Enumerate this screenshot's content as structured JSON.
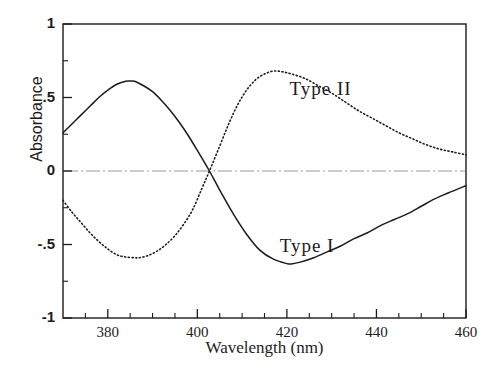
{
  "chart_data": {
    "type": "line",
    "title": "",
    "xlabel": "Wavelength (nm)",
    "ylabel": "Absorbance",
    "xlim": [
      370,
      460
    ],
    "ylim": [
      -1,
      1
    ],
    "grid": false,
    "zero_line": true,
    "legend_position": "inline-annotation",
    "xticks": [
      380,
      400,
      420,
      440,
      460
    ],
    "xtick_labels": [
      "380",
      "400",
      "420",
      "440",
      "460"
    ],
    "xminor_ticks": [
      375,
      385,
      390,
      395,
      405,
      410,
      415,
      425,
      430,
      435,
      445,
      450,
      455
    ],
    "yticks": [
      1,
      0.5,
      0,
      -0.5,
      -1
    ],
    "ytick_labels": [
      "1",
      ".5",
      "0",
      "-.5",
      "-1"
    ],
    "yminor_ticks": [
      0.75,
      0.25,
      -0.25,
      -0.75
    ],
    "series": [
      {
        "name": "Type I",
        "style": "solid",
        "color": "#1c1c1c",
        "label_position": {
          "x": 430,
          "y": -0.52
        },
        "x": [
          370,
          372,
          374,
          376,
          378,
          380,
          382,
          384,
          385,
          386,
          388,
          390,
          392,
          394,
          396,
          398,
          400,
          402.7,
          405,
          408,
          411,
          414,
          417,
          420,
          421,
          423,
          426,
          429,
          432,
          435,
          438,
          441,
          444,
          447,
          450,
          453,
          456,
          460
        ],
        "y": [
          0.26,
          0.32,
          0.38,
          0.44,
          0.5,
          0.55,
          0.59,
          0.61,
          0.612,
          0.61,
          0.58,
          0.54,
          0.48,
          0.41,
          0.33,
          0.24,
          0.14,
          0.0,
          -0.13,
          -0.29,
          -0.43,
          -0.54,
          -0.6,
          -0.63,
          -0.632,
          -0.62,
          -0.59,
          -0.55,
          -0.51,
          -0.46,
          -0.42,
          -0.37,
          -0.33,
          -0.29,
          -0.24,
          -0.19,
          -0.15,
          -0.1
        ]
      },
      {
        "name": "Type II",
        "style": "dotted",
        "color": "#1c1c1c",
        "label_position": {
          "x": 434,
          "y": 0.55
        },
        "x": [
          370,
          372,
          374,
          376,
          378,
          380,
          382,
          384,
          386,
          387,
          389,
          391,
          393,
          395,
          397,
          399,
          401,
          402.7,
          405,
          407,
          409,
          411,
          413,
          415,
          417,
          419,
          421,
          424,
          427,
          430,
          433,
          436,
          439,
          442,
          445,
          448,
          451,
          454,
          457,
          460
        ],
        "y": [
          -0.2,
          -0.28,
          -0.35,
          -0.42,
          -0.48,
          -0.53,
          -0.57,
          -0.585,
          -0.59,
          -0.59,
          -0.575,
          -0.545,
          -0.5,
          -0.44,
          -0.36,
          -0.26,
          -0.12,
          0.0,
          0.17,
          0.32,
          0.45,
          0.55,
          0.62,
          0.66,
          0.68,
          0.675,
          0.66,
          0.63,
          0.58,
          0.53,
          0.47,
          0.41,
          0.36,
          0.31,
          0.26,
          0.22,
          0.18,
          0.15,
          0.13,
          0.11
        ]
      }
    ]
  },
  "plot": {
    "frame_color": "#1c1c1c",
    "background": "#ffffff",
    "zero_line_color": "#9a9a9a"
  }
}
